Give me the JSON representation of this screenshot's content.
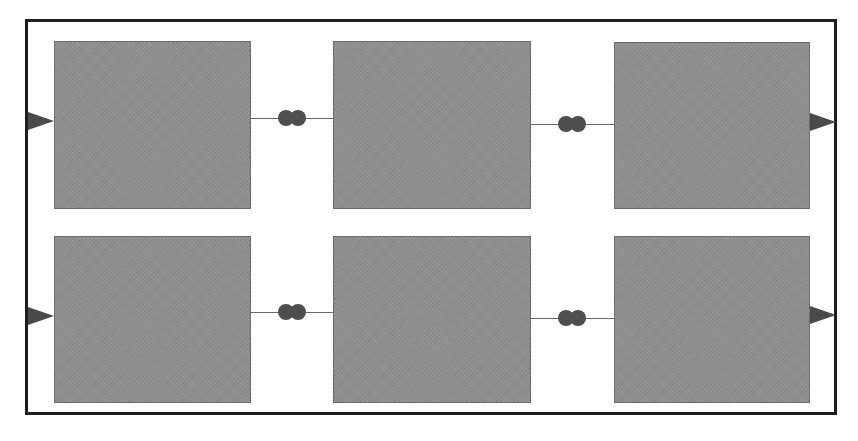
{
  "diagram": {
    "type": "block-diagram",
    "layout": {
      "rows": 2,
      "columns": 3
    },
    "colors": {
      "frame_border": "#1e1e1e",
      "box_fill": "#8f8f8f",
      "box_border": "#6c6c6c",
      "connector": "#4f4f4f",
      "port": "#4a4a4a",
      "wire": "#6a6a6a"
    },
    "blocks": [
      {
        "id": "r1c1",
        "row": 1,
        "col": 1,
        "label": ""
      },
      {
        "id": "r1c2",
        "row": 1,
        "col": 2,
        "label": ""
      },
      {
        "id": "r1c3",
        "row": 1,
        "col": 3,
        "label": ""
      },
      {
        "id": "r2c1",
        "row": 2,
        "col": 1,
        "label": ""
      },
      {
        "id": "r2c2",
        "row": 2,
        "col": 2,
        "label": ""
      },
      {
        "id": "r2c3",
        "row": 2,
        "col": 3,
        "label": ""
      }
    ],
    "connections": [
      {
        "from": "r1c1",
        "to": "r1c2",
        "connector": "double-circle"
      },
      {
        "from": "r1c2",
        "to": "r1c3",
        "connector": "double-circle"
      },
      {
        "from": "r2c1",
        "to": "r2c2",
        "connector": "double-circle"
      },
      {
        "from": "r2c2",
        "to": "r2c3",
        "connector": "double-circle"
      }
    ],
    "ports": [
      {
        "side": "left",
        "row": 1,
        "direction": "input",
        "icon": "triangle-right-icon"
      },
      {
        "side": "left",
        "row": 2,
        "direction": "input",
        "icon": "triangle-right-icon"
      },
      {
        "side": "right",
        "row": 1,
        "direction": "output",
        "icon": "triangle-right-icon"
      },
      {
        "side": "right",
        "row": 2,
        "direction": "output",
        "icon": "triangle-right-icon"
      }
    ]
  }
}
